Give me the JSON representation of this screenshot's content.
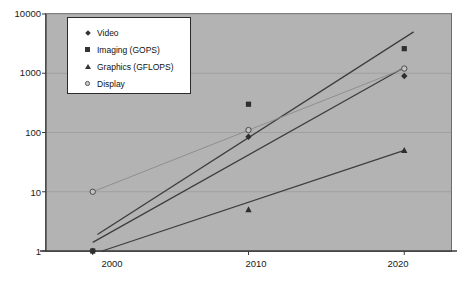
{
  "chart_data": {
    "type": "line",
    "title": "",
    "xlabel": "",
    "ylabel": "",
    "x": [
      2000,
      2010,
      2020
    ],
    "xticklabels": [
      "2000",
      "2010",
      "2020"
    ],
    "yticklabels": [
      "1",
      "10",
      "100",
      "1000",
      "10000"
    ],
    "yticks": [
      1,
      10,
      100,
      1000,
      10000
    ],
    "yscale": "log",
    "ylim": [
      1,
      10000
    ],
    "xlim": [
      1997,
      2023
    ],
    "grid": true,
    "grid_axis": "y",
    "legend_position": "top-left",
    "plot_background": "#b3b3b3",
    "series": [
      {
        "name": "Video",
        "marker": "diamond",
        "color": "#333333",
        "points": [
          {
            "x": 2000,
            "y": 1
          },
          {
            "x": 2010,
            "y": 85
          },
          {
            "x": 2020,
            "y": 900
          }
        ],
        "trendline": {
          "x0": 2000,
          "y0": 1.4,
          "x1": 2020,
          "y1": 1250
        }
      },
      {
        "name": "Imaging (GOPS)",
        "marker": "square",
        "color": "#333333",
        "points": [
          {
            "x": 2000,
            "y": 1
          },
          {
            "x": 2010,
            "y": 300
          },
          {
            "x": 2020,
            "y": 2600
          }
        ],
        "trendline": {
          "x0": 2000.3,
          "y0": 1.9,
          "x1": 2020.6,
          "y1": 5000
        }
      },
      {
        "name": "Graphics (GFLOPS)",
        "marker": "triangle",
        "color": "#333333",
        "points": [
          {
            "x": 2010,
            "y": 5
          },
          {
            "x": 2020,
            "y": 50
          }
        ],
        "trendline": {
          "x0": 2000.6,
          "y0": 1.0,
          "x1": 2020,
          "y1": 50
        }
      },
      {
        "name": "Display",
        "marker": "circle",
        "color": "#777777",
        "points": [
          {
            "x": 2000,
            "y": 10
          },
          {
            "x": 2010,
            "y": 110
          },
          {
            "x": 2020,
            "y": 1200
          }
        ],
        "trendline": {
          "x0": 2000,
          "y0": 10,
          "x1": 2020,
          "y1": 1200
        }
      }
    ]
  },
  "legend": {
    "items": [
      {
        "label": "Video",
        "marker": "diamond"
      },
      {
        "label": "Imaging (GOPS)",
        "marker": "square"
      },
      {
        "label": "Graphics (GFLOPS)",
        "marker": "triangle"
      },
      {
        "label": "Display",
        "marker": "circle"
      }
    ]
  },
  "axes": {
    "y_labels": [
      "10000",
      "1000",
      "100",
      "10",
      "1"
    ],
    "x_labels": [
      "2000",
      "2010",
      "2020"
    ]
  }
}
